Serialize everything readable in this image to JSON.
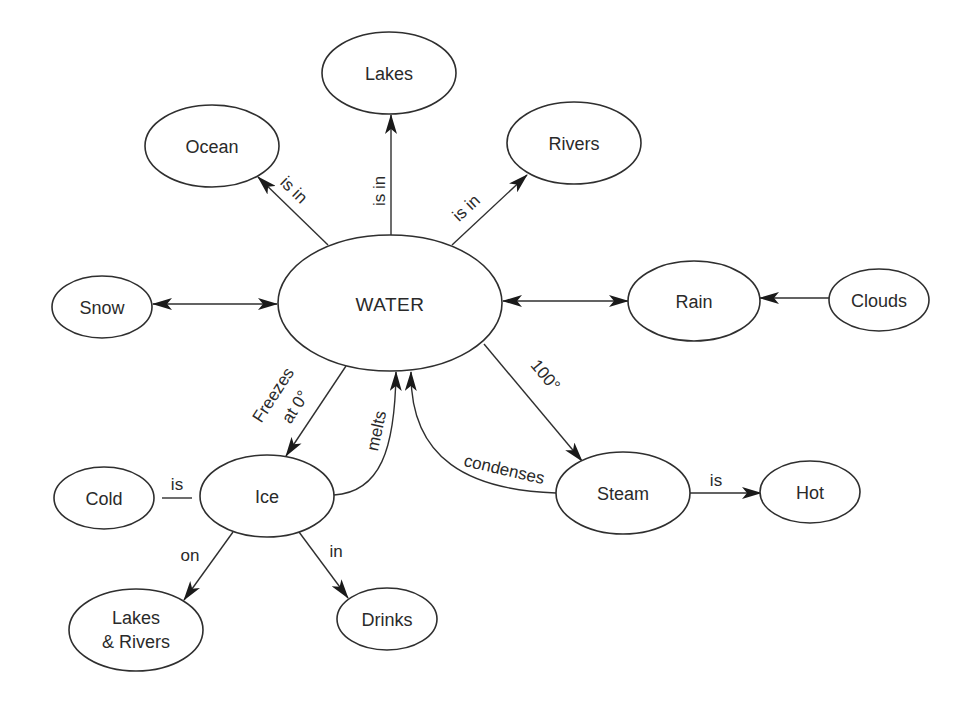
{
  "diagram": {
    "type": "concept-map",
    "central_concept": "WATER",
    "nodes": {
      "water": {
        "label": "WATER",
        "cx": 390,
        "cy": 303,
        "rx": 112,
        "ry": 68
      },
      "lakes": {
        "label": "Lakes",
        "cx": 389,
        "cy": 73,
        "rx": 67,
        "ry": 41
      },
      "ocean": {
        "label": "Ocean",
        "cx": 212,
        "cy": 146,
        "rx": 67,
        "ry": 41
      },
      "rivers": {
        "label": "Rivers",
        "cx": 574,
        "cy": 143,
        "rx": 67,
        "ry": 41
      },
      "snow": {
        "label": "Snow",
        "cx": 102,
        "cy": 307,
        "rx": 50,
        "ry": 31
      },
      "rain": {
        "label": "Rain",
        "cx": 694,
        "cy": 301,
        "rx": 66,
        "ry": 40
      },
      "clouds": {
        "label": "Clouds",
        "cx": 879,
        "cy": 300,
        "rx": 50,
        "ry": 31
      },
      "ice": {
        "label": "Ice",
        "cx": 267,
        "cy": 496,
        "rx": 67,
        "ry": 41
      },
      "cold": {
        "label": "Cold",
        "cx": 104,
        "cy": 498,
        "rx": 50,
        "ry": 31
      },
      "steam": {
        "label": "Steam",
        "cx": 623,
        "cy": 493,
        "rx": 67,
        "ry": 41
      },
      "hot": {
        "label": "Hot",
        "cx": 810,
        "cy": 492,
        "rx": 50,
        "ry": 31
      },
      "lakes_rivers": {
        "label_line1": "Lakes",
        "label_line2": "& Rivers",
        "cx": 136,
        "cy": 630,
        "rx": 67,
        "ry": 41
      },
      "drinks": {
        "label": "Drinks",
        "cx": 387,
        "cy": 619,
        "rx": 50,
        "ry": 31
      }
    },
    "edges": [
      {
        "from": "WATER",
        "to": "Ocean",
        "label": "is in",
        "direction": "forward"
      },
      {
        "from": "WATER",
        "to": "Lakes",
        "label": "is in",
        "direction": "forward"
      },
      {
        "from": "WATER",
        "to": "Rivers",
        "label": "is in",
        "direction": "forward"
      },
      {
        "from": "WATER",
        "to": "Snow",
        "label": "",
        "direction": "both"
      },
      {
        "from": "WATER",
        "to": "Rain",
        "label": "",
        "direction": "both"
      },
      {
        "from": "Clouds",
        "to": "Rain",
        "label": "",
        "direction": "forward"
      },
      {
        "from": "WATER",
        "to": "Ice",
        "label": "Freezes at 0°",
        "direction": "forward"
      },
      {
        "from": "Ice",
        "to": "WATER",
        "label": "melts",
        "direction": "forward"
      },
      {
        "from": "WATER",
        "to": "Steam",
        "label": "100°",
        "direction": "forward"
      },
      {
        "from": "Steam",
        "to": "WATER",
        "label": "condenses",
        "direction": "forward"
      },
      {
        "from": "Steam",
        "to": "Hot",
        "label": "is",
        "direction": "forward"
      },
      {
        "from": "Ice",
        "to": "Cold",
        "label": "is",
        "direction": "none"
      },
      {
        "from": "Ice",
        "to": "Lakes & Rivers",
        "label": "on",
        "direction": "forward"
      },
      {
        "from": "Ice",
        "to": "Drinks",
        "label": "in",
        "direction": "forward"
      }
    ],
    "edge_labels": {
      "ocean_is_in": "is in",
      "lakes_is_in": "is in",
      "rivers_is_in": "is in",
      "freezes_line1": "Freezes",
      "freezes_line2": "at 0°",
      "melts": "melts",
      "boil": "100°",
      "condenses": "condenses",
      "steam_is": "is",
      "ice_is": "is",
      "ice_on": "on",
      "ice_in": "in"
    },
    "colors": {
      "stroke": "#2f2f2f",
      "text": "#2a2a2a",
      "background": "#ffffff"
    }
  }
}
